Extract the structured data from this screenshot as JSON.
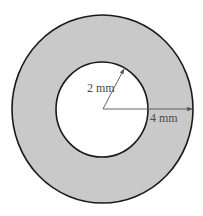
{
  "diagram": {
    "type": "annulus",
    "colors": {
      "ring_fill": "#c9c9c9",
      "hole_fill": "#ffffff",
      "stroke": "#1a1a1a",
      "arrow": "#555555"
    },
    "inner_radius_label": "2 mm",
    "outer_radius_label": "4 mm"
  }
}
